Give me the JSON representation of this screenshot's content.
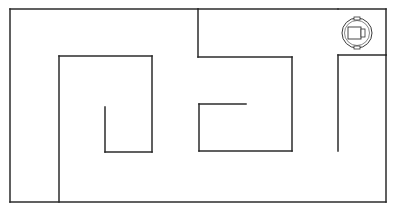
{
  "maze": {
    "background": "#ffffff",
    "wall_color": "#2b2b2b",
    "walls": [
      {
        "id": "outer-top-left",
        "x1": 10,
        "y1": 9,
        "x2": 198,
        "y2": 9
      },
      {
        "id": "outer-top-right",
        "x1": 198,
        "y1": 9,
        "x2": 338,
        "y2": 9
      },
      {
        "id": "outer-left",
        "x1": 10,
        "y1": 9,
        "x2": 10,
        "y2": 202
      },
      {
        "id": "outer-bottom",
        "x1": 10,
        "y1": 202,
        "x2": 386,
        "y2": 202
      },
      {
        "id": "outer-right",
        "x1": 386,
        "y1": 55,
        "x2": 386,
        "y2": 202
      },
      {
        "id": "top-right-corner-h",
        "x1": 338,
        "y1": 9,
        "x2": 386,
        "y2": 9
      },
      {
        "id": "top-right-corner-v",
        "x1": 386,
        "y1": 9,
        "x2": 386,
        "y2": 55
      },
      {
        "id": "right-ledge-h",
        "x1": 338,
        "y1": 55,
        "x2": 386,
        "y2": 55
      },
      {
        "id": "right-ledge-v",
        "x1": 338,
        "y1": 55,
        "x2": 338,
        "y2": 151
      },
      {
        "id": "inner-left-v",
        "x1": 59,
        "y1": 56,
        "x2": 59,
        "y2": 202
      },
      {
        "id": "inner-top-h",
        "x1": 59,
        "y1": 56,
        "x2": 152,
        "y2": 56
      },
      {
        "id": "inner-mid-v",
        "x1": 152,
        "y1": 56,
        "x2": 152,
        "y2": 152
      },
      {
        "id": "small-u-bottom",
        "x1": 105,
        "y1": 152,
        "x2": 152,
        "y2": 152
      },
      {
        "id": "small-u-left",
        "x1": 105,
        "y1": 107,
        "x2": 105,
        "y2": 152
      },
      {
        "id": "center-top-v",
        "x1": 198,
        "y1": 9,
        "x2": 198,
        "y2": 57
      },
      {
        "id": "center-top-h",
        "x1": 198,
        "y1": 57,
        "x2": 292,
        "y2": 57
      },
      {
        "id": "center-right-v",
        "x1": 292,
        "y1": 57,
        "x2": 292,
        "y2": 151
      },
      {
        "id": "center-box-bottom",
        "x1": 199,
        "y1": 151,
        "x2": 292,
        "y2": 151
      },
      {
        "id": "center-box-left",
        "x1": 199,
        "y1": 104,
        "x2": 199,
        "y2": 151
      },
      {
        "id": "center-box-top",
        "x1": 199,
        "y1": 104,
        "x2": 246,
        "y2": 104
      }
    ]
  },
  "robot": {
    "label": "robot",
    "cx": 357,
    "cy": 33,
    "r": 15,
    "heading": "right"
  }
}
